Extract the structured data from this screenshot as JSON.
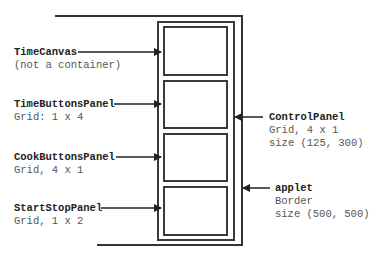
{
  "diagram": {
    "components": [
      {
        "name": "TimeCanvas",
        "detail": [
          "(not a container)"
        ]
      },
      {
        "name": "TimeButtonsPanel",
        "detail": [
          "Grid: 1 x 4"
        ]
      },
      {
        "name": "CookButtonsPanel",
        "detail": [
          "Grid, 4 x 1"
        ]
      },
      {
        "name": "StartStopPanel",
        "detail": [
          "Grid, 1 x 2"
        ]
      },
      {
        "name": "ControlPanel",
        "detail": [
          "Grid, 4 x 1",
          "size (125, 300)"
        ]
      },
      {
        "name": "applet",
        "detail": [
          "Border",
          "size (500, 500)"
        ]
      }
    ],
    "colors": {
      "line": "#333333",
      "title_text": "#222222",
      "detail_text": "#555555"
    }
  }
}
